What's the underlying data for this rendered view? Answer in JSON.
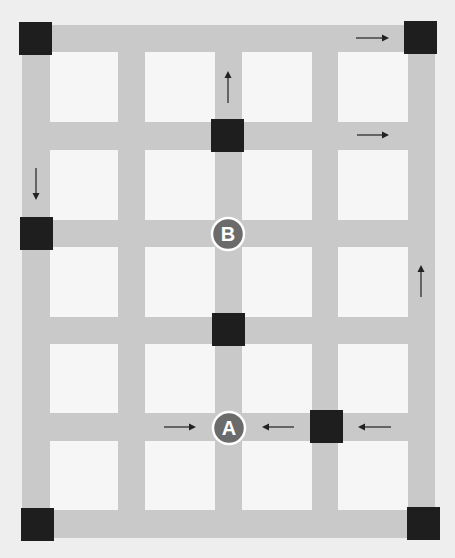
{
  "diagram": {
    "type": "street-grid-route-map",
    "colors": {
      "background": "#eeeeee",
      "road": "#c9c9c9",
      "block": "#f6f6f6",
      "intersection_square": "#1e1e1e",
      "marker_fill": "#6b6b6b",
      "marker_text": "#ffffff",
      "arrow": "#222222"
    },
    "vertical_roads_x": [
      [
        22,
        50
      ],
      [
        118,
        145
      ],
      [
        215,
        242
      ],
      [
        312,
        338
      ],
      [
        408,
        435
      ]
    ],
    "horizontal_roads_y": [
      [
        25,
        52
      ],
      [
        122,
        150
      ],
      [
        220,
        247
      ],
      [
        317,
        344
      ],
      [
        413,
        441
      ],
      [
        510,
        538
      ]
    ],
    "squares": [
      {
        "id": "sq-top-left",
        "x": 19,
        "y": 22
      },
      {
        "id": "sq-top-right",
        "x": 404,
        "y": 21
      },
      {
        "id": "sq-row2-center",
        "x": 211,
        "y": 119
      },
      {
        "id": "sq-row3-left",
        "x": 20,
        "y": 217
      },
      {
        "id": "sq-row4-center",
        "x": 212,
        "y": 313
      },
      {
        "id": "sq-row5-right",
        "x": 310,
        "y": 410
      },
      {
        "id": "sq-bottom-left",
        "x": 21,
        "y": 508
      },
      {
        "id": "sq-bottom-right",
        "x": 407,
        "y": 507
      }
    ],
    "markers": [
      {
        "label": "B",
        "cx": 228,
        "cy": 234,
        "r": 16
      },
      {
        "label": "A",
        "cx": 229,
        "cy": 428,
        "r": 16
      }
    ],
    "arrows": [
      {
        "id": "arrow-top-right",
        "direction": "right",
        "x1": 356,
        "y1": 38,
        "x2": 389,
        "y2": 38
      },
      {
        "id": "arrow-up-center",
        "direction": "up",
        "x1": 228,
        "y1": 103,
        "x2": 228,
        "y2": 71
      },
      {
        "id": "arrow-row2-right",
        "direction": "right",
        "x1": 357,
        "y1": 135,
        "x2": 389,
        "y2": 135
      },
      {
        "id": "arrow-down-left",
        "direction": "down",
        "x1": 36,
        "y1": 168,
        "x2": 36,
        "y2": 200
      },
      {
        "id": "arrow-up-right-edge",
        "direction": "up",
        "x1": 421,
        "y1": 297,
        "x2": 421,
        "y2": 265
      },
      {
        "id": "arrow-toward-A-from-left",
        "direction": "right",
        "x1": 164,
        "y1": 427,
        "x2": 196,
        "y2": 427
      },
      {
        "id": "arrow-toward-A-from-right",
        "direction": "left",
        "x1": 294,
        "y1": 427,
        "x2": 262,
        "y2": 427
      },
      {
        "id": "arrow-row5-far-right",
        "direction": "left",
        "x1": 391,
        "y1": 427,
        "x2": 358,
        "y2": 427
      }
    ]
  }
}
